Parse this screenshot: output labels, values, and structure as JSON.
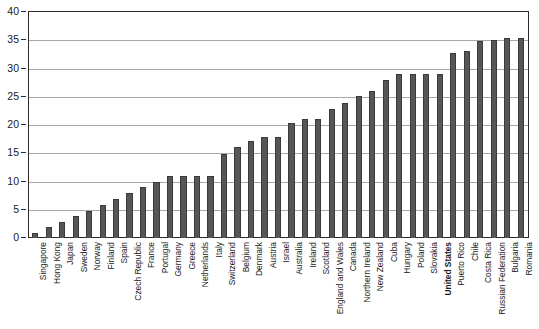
{
  "chart_data": {
    "type": "bar",
    "title": "",
    "subtitle": "",
    "xlabel": "",
    "ylabel": "",
    "ylim": [
      0,
      40
    ],
    "ytick_step": 5,
    "yticks": [
      0,
      5,
      10,
      15,
      20,
      25,
      30,
      35,
      40
    ],
    "grid": true,
    "legend": "none",
    "bar_color": "#565656",
    "bar_edge_color": "#3a3a3a",
    "axis_color": "#2b2b2b",
    "gridline_color": "#a8a8a8",
    "highlight_category": "United States",
    "categories": [
      "Singapore",
      "Hong Kong",
      "Japan",
      "Sweden",
      "Norway",
      "Finland",
      "Spain",
      "Czech Republic",
      "France",
      "Portugal",
      "Germany",
      "Greece",
      "Netherlands",
      "Italy",
      "Switzerland",
      "Belgium",
      "Denmark",
      "Austria",
      "Israel",
      "Australia",
      "Ireland",
      "Scotland",
      "England and Wales",
      "Canada",
      "Northern Ireland",
      "New Zealand",
      "Cuba",
      "Hungary",
      "Poland",
      "Slovakia",
      "United States",
      "Puerto Rico",
      "Chile",
      "Costa Rica",
      "Russian Federation",
      "Bulgaria",
      "Romania"
    ],
    "values": [
      0.8,
      1.9,
      2.9,
      3.9,
      4.8,
      5.9,
      6.9,
      8.0,
      9.1,
      10.0,
      11.0,
      11.0,
      11.0,
      11.0,
      14.8,
      16.1,
      17.2,
      17.9,
      17.9,
      20.4,
      21.0,
      21.0,
      22.9,
      23.9,
      25.1,
      26.1,
      28.0,
      29.0,
      29.0,
      29.0,
      29.0,
      32.8,
      33.1,
      34.8,
      35.1,
      35.4,
      35.4
    ]
  }
}
